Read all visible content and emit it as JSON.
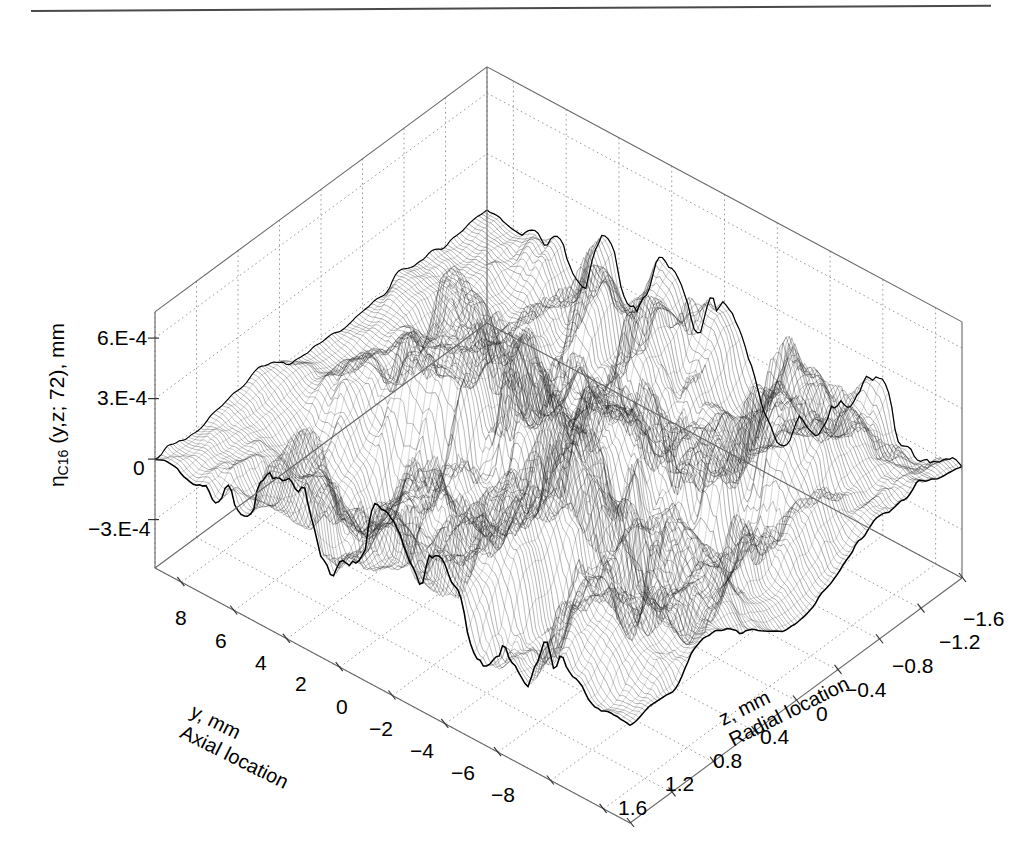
{
  "figure": {
    "type": "3d-surface-wireframe",
    "background": "#ffffff",
    "mesh_color": "#1a1a1a",
    "grid_color": "#9a9a9a",
    "axis_color": "#666666",
    "scan_rule_color": "#4a4a4a"
  },
  "chart_data": {
    "type": "line",
    "subtype": "3d-mesh-surface",
    "title": "",
    "zlabel_plain": "ηC16 (y,z; 72), mm",
    "zlabel_symbol": "η",
    "zlabel_subscript": "C16",
    "zlabel_args": " (y,z; 72), mm",
    "xlabel": "z, mm",
    "xlabel_sub": "Radial location",
    "ylabel": "y, mm",
    "ylabel_sub": "Axial location",
    "zticks": [
      "6.E-4",
      "3.E-4",
      "0",
      "-3.E-4"
    ],
    "ztick_values": [
      0.0006,
      0.0003,
      0,
      -0.0003
    ],
    "zlim": [
      -0.0006,
      0.0007
    ],
    "yticks": [
      "8",
      "6",
      "4",
      "2",
      "0",
      "-2",
      "-4",
      "-6",
      "-8"
    ],
    "ytick_values": [
      8,
      6,
      4,
      2,
      0,
      -2,
      -4,
      -6,
      -8
    ],
    "ylim": [
      -9,
      9
    ],
    "xticks": [
      "1.6",
      "1.2",
      "0.8",
      "0.4",
      "0",
      "-0.4",
      "-0.8",
      "-1.2",
      "-1.6"
    ],
    "xtick_values": [
      1.6,
      1.2,
      0.8,
      0.4,
      0,
      -0.4,
      -0.8,
      -1.2,
      -1.6
    ],
    "xlim": [
      -1.6,
      1.6
    ],
    "grid": true,
    "legend": "none",
    "mesh_rows": 150,
    "mesh_cols": 110,
    "z_peak_max": 0.0007,
    "z_peak_min": -0.00055
  },
  "zticks": [
    {
      "text": "6.E-4",
      "x": 97,
      "y": 327
    },
    {
      "text": "3.E-4",
      "x": 97,
      "y": 387
    },
    {
      "text": "0",
      "x": 133,
      "y": 457
    },
    {
      "text": "-3.E-4",
      "x": 88,
      "y": 518
    }
  ],
  "yticks": [
    {
      "text": "8",
      "x": 175,
      "y": 607
    },
    {
      "text": "6",
      "x": 215,
      "y": 630
    },
    {
      "text": "4",
      "x": 255,
      "y": 652
    },
    {
      "text": "2",
      "x": 295,
      "y": 673
    },
    {
      "text": "0",
      "x": 336,
      "y": 696
    },
    {
      "text": "-2",
      "x": 369,
      "y": 718
    },
    {
      "text": "-4",
      "x": 410,
      "y": 740
    },
    {
      "text": "-6",
      "x": 451,
      "y": 762
    },
    {
      "text": "-8",
      "x": 491,
      "y": 784
    }
  ],
  "xticks": [
    {
      "text": "1.6",
      "x": 618,
      "y": 797
    },
    {
      "text": "1.2",
      "x": 665,
      "y": 773
    },
    {
      "text": "0.8",
      "x": 713,
      "y": 750
    },
    {
      "text": "0.4",
      "x": 760,
      "y": 726
    },
    {
      "text": "0",
      "x": 816,
      "y": 703
    },
    {
      "text": "-0.4",
      "x": 845,
      "y": 679
    },
    {
      "text": "-0.8",
      "x": 892,
      "y": 655
    },
    {
      "text": "-1.2",
      "x": 939,
      "y": 631
    },
    {
      "text": "-1.6",
      "x": 963,
      "y": 608
    }
  ]
}
